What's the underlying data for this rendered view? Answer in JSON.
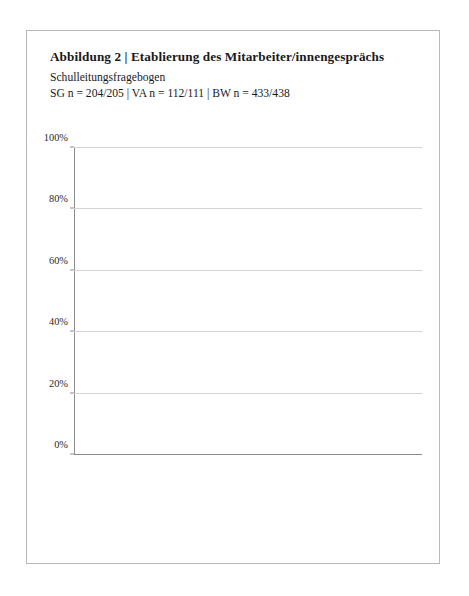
{
  "header": {
    "title": "Abbildung 2 | Etablierung des Mitarbeiter/innengesprächs",
    "subtitle": "Schulleitungsfragebogen",
    "sample_sizes": "SG n = 204/205 | VA n = 112/111 | BW n = 433/438"
  },
  "chart_data": {
    "type": "bar",
    "title": "Abbildung 2 | Etablierung des Mitarbeiter/innengesprächs",
    "subtitle": "Schulleitungsfragebogen",
    "annotation": "SG n = 204/205 | VA n = 112/111 | BW n = 433/438",
    "xlabel": "",
    "ylabel": "",
    "ylim": [
      0,
      100
    ],
    "ytick_labels": [
      "0%",
      "20%",
      "40%",
      "60%",
      "80%",
      "100%"
    ],
    "ytick_values": [
      0,
      20,
      40,
      60,
      80,
      100
    ],
    "grid": true,
    "legend_position": "bottom",
    "groups": [
      {
        "name": "Beratendes MAG/\nJahresgespräch",
        "categories": [
          "SG",
          "VA",
          "BW"
        ],
        "series": [
          {
            "name": "fest etabliert und regelmäßig angewendet",
            "values": [
              79,
              18,
              26
            ]
          },
          {
            "name": "fest etabliert, aber unregelmäßig angewendet",
            "values": [
              10,
              41,
              31
            ]
          },
          {
            "name": "nicht etabliert und nur bei Bedarf angewendet",
            "values": [
              9,
              34,
              38.5
            ]
          },
          {
            "name": "kommt nicht zur Anwendung",
            "values": [
              1,
              6.5,
              4
            ]
          }
        ]
      },
      {
        "name": "MAG mit schriftlicher\nZielvereinbarung",
        "categories": [
          "SG",
          "VA",
          "BW"
        ],
        "series": [
          {
            "name": "fest etabliert und regelmäßig angewendet",
            "values": [
              82,
              7,
              11
            ]
          },
          {
            "name": "fest etabliert, aber unregelmäßig angewendet",
            "values": [
              8,
              14,
              14
            ]
          },
          {
            "name": "nicht etabliert und nur bei Bedarf angewendet",
            "values": [
              7,
              39,
              48
            ]
          },
          {
            "name": "kommt nicht zur Anwendung",
            "values": [
              2,
              39.5,
              26.5
            ]
          }
        ]
      }
    ],
    "series_colors": [
      "#6d6d6d",
      "#8f8f8f",
      "#b0b0b0",
      "#d6d6d6"
    ],
    "legend": [
      "fest etabliert und regelmäßig angewendet",
      "fest etabliert, aber unregelmäßig angewendet",
      "nicht etabliert und nur bei Bedarf angewendet",
      "kommt nicht zur Anwendung"
    ]
  }
}
